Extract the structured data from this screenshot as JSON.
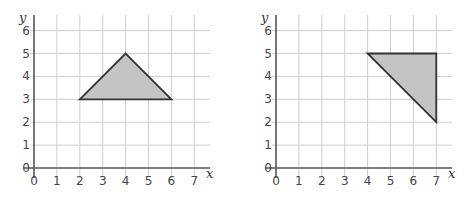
{
  "chart_data": [
    {
      "type": "scatter",
      "title": "",
      "xlabel": "x",
      "ylabel": "y",
      "xlim": [
        0,
        7
      ],
      "ylim": [
        0,
        6
      ],
      "grid": true,
      "x_ticks": [
        "0",
        "1",
        "2",
        "3",
        "4",
        "5",
        "6",
        "7"
      ],
      "y_ticks": [
        "0",
        "1",
        "2",
        "3",
        "4",
        "5",
        "6"
      ],
      "shape": "triangle",
      "fill": "#c4c4c4",
      "vertices": [
        [
          2,
          3
        ],
        [
          4,
          5
        ],
        [
          6,
          3
        ]
      ]
    },
    {
      "type": "scatter",
      "title": "",
      "xlabel": "x",
      "ylabel": "y",
      "xlim": [
        0,
        7
      ],
      "ylim": [
        0,
        6
      ],
      "grid": true,
      "x_ticks": [
        "0",
        "1",
        "2",
        "3",
        "4",
        "5",
        "6",
        "7"
      ],
      "y_ticks": [
        "0",
        "1",
        "2",
        "3",
        "4",
        "5",
        "6"
      ],
      "shape": "triangle",
      "fill": "#c4c4c4",
      "vertices": [
        [
          4,
          5
        ],
        [
          7,
          5
        ],
        [
          7,
          2
        ]
      ]
    }
  ]
}
